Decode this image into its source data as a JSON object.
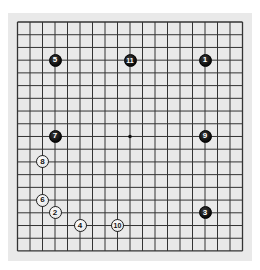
{
  "board": {
    "size": 19,
    "background": "#e9e9e9",
    "line_color": "#333333",
    "star_points": [
      [
        9,
        9
      ]
    ],
    "grid": {
      "x0": 17.5,
      "y0": 22,
      "dx": 12.5,
      "dy": 12.72
    }
  },
  "stones": [
    {
      "move": "1",
      "color": "black",
      "col": 15,
      "row": 3
    },
    {
      "move": "2",
      "color": "white",
      "col": 3,
      "row": 15
    },
    {
      "move": "3",
      "color": "black",
      "col": 15,
      "row": 15
    },
    {
      "move": "4",
      "color": "white",
      "col": 5,
      "row": 16
    },
    {
      "move": "5",
      "color": "black",
      "col": 3,
      "row": 3
    },
    {
      "move": "6",
      "color": "white",
      "col": 2,
      "row": 14
    },
    {
      "move": "7",
      "color": "black",
      "col": 3,
      "row": 9
    },
    {
      "move": "8",
      "color": "white",
      "col": 2,
      "row": 11
    },
    {
      "move": "9",
      "color": "black",
      "col": 15,
      "row": 9
    },
    {
      "move": "10",
      "color": "white",
      "col": 8,
      "row": 16
    },
    {
      "move": "11",
      "color": "black",
      "col": 9,
      "row": 3
    }
  ]
}
